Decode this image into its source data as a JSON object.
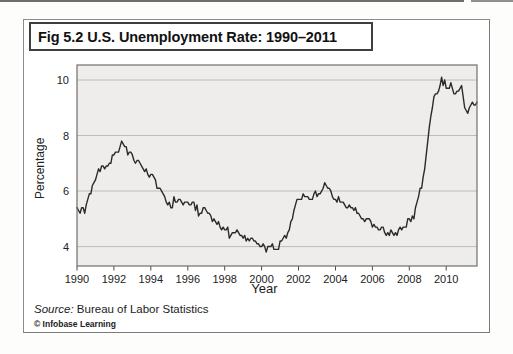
{
  "figure": {
    "title": "Fig 5.2 U.S. Unemployment Rate: 1990–2011",
    "source_label": "Source:",
    "source_text": " Bureau of Labor Statistics",
    "copyright": "© Infobase Learning"
  },
  "chart_data": {
    "type": "line",
    "title": "U.S. Unemployment Rate: 1990–2011",
    "xlabel": "Year",
    "ylabel": "Percentage",
    "frequency": "monthly",
    "x_start_year": 1990,
    "x_end_label": "late 2011",
    "xticks": [
      1990,
      1992,
      1994,
      1996,
      1998,
      2000,
      2002,
      2004,
      2006,
      2008,
      2010
    ],
    "yticks": [
      4,
      6,
      8,
      10
    ],
    "ylim_drawn": [
      3.3,
      10.54
    ],
    "grid": "horizontal",
    "legend": "none",
    "line_color": "#2b2b2b",
    "plot_bg": "#eeedeb",
    "grid_color": "#bcbcbc",
    "series": [
      {
        "name": "U.S. unemployment rate (%)",
        "values": [
          5.4,
          5.3,
          5.2,
          5.4,
          5.4,
          5.2,
          5.5,
          5.7,
          5.9,
          5.9,
          6.2,
          6.3,
          6.4,
          6.6,
          6.8,
          6.7,
          6.9,
          6.9,
          6.8,
          6.9,
          6.9,
          7.0,
          7.0,
          7.3,
          7.3,
          7.4,
          7.4,
          7.4,
          7.6,
          7.8,
          7.7,
          7.6,
          7.6,
          7.3,
          7.4,
          7.4,
          7.3,
          7.1,
          7.0,
          7.1,
          7.1,
          7.0,
          6.9,
          6.8,
          6.7,
          6.8,
          6.6,
          6.5,
          6.6,
          6.6,
          6.5,
          6.4,
          6.1,
          6.1,
          6.1,
          6.0,
          5.9,
          5.8,
          5.6,
          5.5,
          5.6,
          5.4,
          5.4,
          5.8,
          5.6,
          5.6,
          5.7,
          5.7,
          5.6,
          5.5,
          5.6,
          5.6,
          5.6,
          5.5,
          5.5,
          5.6,
          5.6,
          5.3,
          5.5,
          5.1,
          5.2,
          5.2,
          5.4,
          5.4,
          5.3,
          5.2,
          5.2,
          5.1,
          4.9,
          5.0,
          4.9,
          4.8,
          4.9,
          4.7,
          4.6,
          4.7,
          4.6,
          4.6,
          4.7,
          4.3,
          4.4,
          4.5,
          4.5,
          4.5,
          4.6,
          4.5,
          4.4,
          4.4,
          4.3,
          4.4,
          4.2,
          4.3,
          4.2,
          4.3,
          4.3,
          4.2,
          4.2,
          4.1,
          4.1,
          4.0,
          4.0,
          4.1,
          4.0,
          3.8,
          4.0,
          4.0,
          4.0,
          4.1,
          3.9,
          3.9,
          3.9,
          3.9,
          4.2,
          4.2,
          4.3,
          4.4,
          4.3,
          4.5,
          4.6,
          4.9,
          5.0,
          5.3,
          5.5,
          5.7,
          5.7,
          5.7,
          5.7,
          5.9,
          5.8,
          5.8,
          5.8,
          5.7,
          5.7,
          5.7,
          5.9,
          6.0,
          5.8,
          5.9,
          5.9,
          6.0,
          6.1,
          6.3,
          6.2,
          6.1,
          6.1,
          6.0,
          5.8,
          5.7,
          5.7,
          5.6,
          5.8,
          5.6,
          5.6,
          5.6,
          5.5,
          5.4,
          5.4,
          5.5,
          5.4,
          5.4,
          5.3,
          5.4,
          5.2,
          5.2,
          5.1,
          5.0,
          5.0,
          4.9,
          5.0,
          5.0,
          5.0,
          4.9,
          4.7,
          4.8,
          4.7,
          4.7,
          4.6,
          4.6,
          4.7,
          4.7,
          4.5,
          4.4,
          4.5,
          4.4,
          4.6,
          4.5,
          4.4,
          4.5,
          4.4,
          4.6,
          4.7,
          4.6,
          4.7,
          4.7,
          4.7,
          5.0,
          5.0,
          4.9,
          5.1,
          5.0,
          5.4,
          5.6,
          5.8,
          6.1,
          6.1,
          6.5,
          6.8,
          7.3,
          7.8,
          8.3,
          8.7,
          9.0,
          9.4,
          9.5,
          9.5,
          9.6,
          9.8,
          10.1,
          9.8,
          10.0,
          9.7,
          9.7,
          9.7,
          9.9,
          9.7,
          9.5,
          9.5,
          9.6,
          9.6,
          9.7,
          9.8,
          9.4,
          9.0,
          8.9,
          8.8,
          9.0,
          9.1,
          9.2,
          9.1,
          9.1,
          9.2
        ]
      }
    ]
  }
}
